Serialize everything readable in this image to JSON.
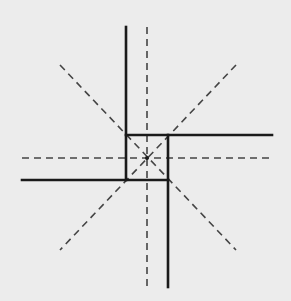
{
  "diagram": {
    "background": "#ececec",
    "stroke_color": "#1a1a1a",
    "dash_color": "#444444",
    "center": [
      147,
      158
    ],
    "solid_lines": [
      {
        "name": "solid-vertical-upper",
        "x1": 126,
        "y1": 27,
        "x2": 126,
        "y2": 180
      },
      {
        "name": "solid-horizontal-right",
        "x1": 126,
        "y1": 135,
        "x2": 272,
        "y2": 135
      },
      {
        "name": "solid-vertical-lower",
        "x1": 168,
        "y1": 135,
        "x2": 168,
        "y2": 287
      },
      {
        "name": "solid-horizontal-left",
        "x1": 22,
        "y1": 180,
        "x2": 168,
        "y2": 180
      }
    ],
    "dashed_lines": [
      {
        "name": "dashed-vertical-axis",
        "x1": 147,
        "y1": 27,
        "x2": 147,
        "y2": 287
      },
      {
        "name": "dashed-horizontal-axis",
        "x1": 22,
        "y1": 158,
        "x2": 272,
        "y2": 158
      },
      {
        "name": "dashed-diagonal-nw-se",
        "x1": 60,
        "y1": 65,
        "x2": 236,
        "y2": 250
      },
      {
        "name": "dashed-diagonal-ne-sw",
        "x1": 236,
        "y1": 65,
        "x2": 60,
        "y2": 250
      }
    ],
    "center_point": {
      "cx": 147,
      "cy": 158,
      "r": 2
    }
  }
}
